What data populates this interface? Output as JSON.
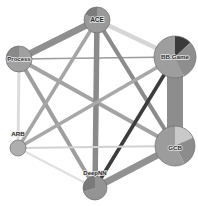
{
  "figure": {
    "title": "",
    "type": "network-graph",
    "background_color": "#ffffff",
    "width": 198,
    "height": 206
  },
  "chart_data": {
    "type": "network",
    "title": "",
    "layout": "hexagonal-circular",
    "node_glyph": "pie",
    "nodes": [
      {
        "id": "ace",
        "label": "ACE",
        "x": 97,
        "y": 20,
        "radius": 13,
        "label_dx": 0,
        "label_dy": 2,
        "font_size": 6.5,
        "pie": [
          {
            "name": "slice-a",
            "value": 82,
            "color": "#9a9a9a"
          },
          {
            "name": "slice-b",
            "value": 18,
            "color": "#7c7c7c"
          }
        ]
      },
      {
        "id": "process",
        "label": "Process",
        "x": 19,
        "y": 59,
        "radius": 13,
        "label_dx": 0,
        "label_dy": 2,
        "font_size": 6.0,
        "pie": [
          {
            "name": "slice-a",
            "value": 74,
            "color": "#a0a0a0"
          },
          {
            "name": "slice-b",
            "value": 26,
            "color": "#888888"
          }
        ]
      },
      {
        "id": "bbgame",
        "label": "BB.Game",
        "x": 175,
        "y": 57,
        "radius": 21,
        "label_dx": 0,
        "label_dy": 2,
        "font_size": 6.2,
        "pie": [
          {
            "name": "slice-a",
            "value": 13,
            "color": "#3a3a3a"
          },
          {
            "name": "slice-b",
            "value": 30,
            "color": "#8e8e8e"
          },
          {
            "name": "slice-c",
            "value": 57,
            "color": "#9e9e9e"
          }
        ]
      },
      {
        "id": "arb",
        "label": "ARB",
        "x": 18,
        "y": 148,
        "radius": 8,
        "label_dx": 0,
        "label_dy": -12,
        "font_size": 6.2,
        "pie": [
          {
            "name": "slice-a",
            "value": 100,
            "color": "#aeaeae"
          }
        ]
      },
      {
        "id": "gcb",
        "label": "GCB",
        "x": 175,
        "y": 146,
        "radius": 20,
        "label_dx": 0,
        "label_dy": 4,
        "font_size": 6.2,
        "pie": [
          {
            "name": "slice-a",
            "value": 18,
            "color": "#c9c9c9"
          },
          {
            "name": "slice-b",
            "value": 24,
            "color": "#8c8c8c"
          },
          {
            "name": "slice-c",
            "value": 58,
            "color": "#9c9c9c"
          }
        ]
      },
      {
        "id": "deepnn",
        "label": "DeepNN",
        "x": 95,
        "y": 188,
        "radius": 12,
        "label_dx": 0,
        "label_dy": -13,
        "font_size": 6.0,
        "pie": [
          {
            "name": "slice-a",
            "value": 70,
            "color": "#949494"
          },
          {
            "name": "slice-b",
            "value": 30,
            "color": "#7a7a7a"
          }
        ]
      }
    ],
    "edges": [
      {
        "source": "process",
        "target": "ace",
        "width": 6.5,
        "color": "#8f8f8f"
      },
      {
        "source": "ace",
        "target": "bbgame",
        "width": 4.5,
        "color": "#d6d6d6"
      },
      {
        "source": "process",
        "target": "bbgame",
        "width": 1.6,
        "color": "#9b9b9b"
      },
      {
        "source": "process",
        "target": "arb",
        "width": 3.0,
        "color": "#dcdcdc"
      },
      {
        "source": "process",
        "target": "gcb",
        "width": 4.0,
        "color": "#a3a3a3"
      },
      {
        "source": "process",
        "target": "deepnn",
        "width": 4.0,
        "color": "#9e9e9e"
      },
      {
        "source": "ace",
        "target": "arb",
        "width": 3.5,
        "color": "#a5a5a5"
      },
      {
        "source": "ace",
        "target": "gcb",
        "width": 4.2,
        "color": "#8b8b8b"
      },
      {
        "source": "ace",
        "target": "deepnn",
        "width": 5.5,
        "color": "#8a8a8a"
      },
      {
        "source": "bbgame",
        "target": "gcb",
        "width": 16.0,
        "color": "#8d8d8d"
      },
      {
        "source": "bbgame",
        "target": "arb",
        "width": 3.6,
        "color": "#a8a8a8"
      },
      {
        "source": "bbgame",
        "target": "deepnn",
        "width": 3.6,
        "color": "#3c3c3c"
      },
      {
        "source": "arb",
        "target": "gcb",
        "width": 2.2,
        "color": "#d2d2d2"
      },
      {
        "source": "arb",
        "target": "deepnn",
        "width": 2.0,
        "color": "#e0e0e0"
      },
      {
        "source": "gcb",
        "target": "deepnn",
        "width": 6.5,
        "color": "#919191"
      }
    ]
  }
}
